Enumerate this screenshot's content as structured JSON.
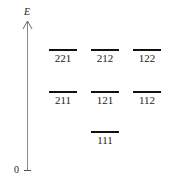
{
  "axis": {
    "label": "E",
    "origin_label": "0"
  },
  "levels": [
    {
      "label": "221",
      "row": 0,
      "col": 0
    },
    {
      "label": "212",
      "row": 0,
      "col": 1
    },
    {
      "label": "122",
      "row": 0,
      "col": 2
    },
    {
      "label": "211",
      "row": 1,
      "col": 0
    },
    {
      "label": "121",
      "row": 1,
      "col": 1
    },
    {
      "label": "112",
      "row": 1,
      "col": 2
    },
    {
      "label": "111",
      "row": 2,
      "col": 1
    }
  ]
}
